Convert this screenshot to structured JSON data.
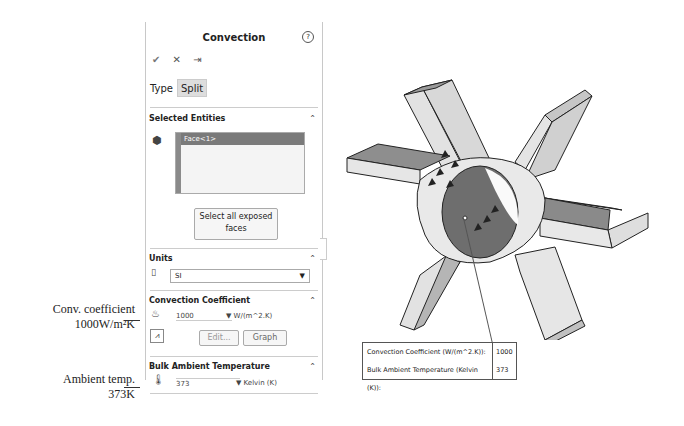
{
  "panel": {
    "title": "Convection",
    "help_icon": "?",
    "actions": [
      {
        "name": "ok",
        "glyph": "✔"
      },
      {
        "name": "cancel",
        "glyph": "✕"
      },
      {
        "name": "pin",
        "glyph": "⇥"
      }
    ],
    "tabs": [
      {
        "label": "Type",
        "active": true
      },
      {
        "label": "Split",
        "active": false
      }
    ],
    "selected_entities": {
      "header": "Selected Entities",
      "items": [
        "Face<1>"
      ],
      "select_all_button": "Select all exposed faces"
    },
    "units": {
      "header": "Units",
      "value": "SI"
    },
    "convection_coefficient": {
      "header": "Convection Coefficient",
      "value": "1000",
      "unit": "W/(m^2.K)",
      "edit_button": "Edit...",
      "graph_button": "Graph"
    },
    "bulk_ambient_temperature": {
      "header": "Bulk Ambient Temperature",
      "value": "373",
      "unit": "Kelvin (K)"
    }
  },
  "annotations": {
    "conv_line1": "Conv. coefficient",
    "conv_line2": "1000W/m²K",
    "temp_line1": "Ambient temp.",
    "temp_line2": "373K"
  },
  "callout": {
    "rows": [
      {
        "label": "Convection Coefficient (W/(m^2.K)):",
        "value": "1000"
      },
      {
        "label": "Bulk Ambient Temperature (Kelvin (K)):",
        "value": "373"
      }
    ]
  },
  "model": {
    "description": "Six-blade impeller with convection applied to inner bore face"
  }
}
